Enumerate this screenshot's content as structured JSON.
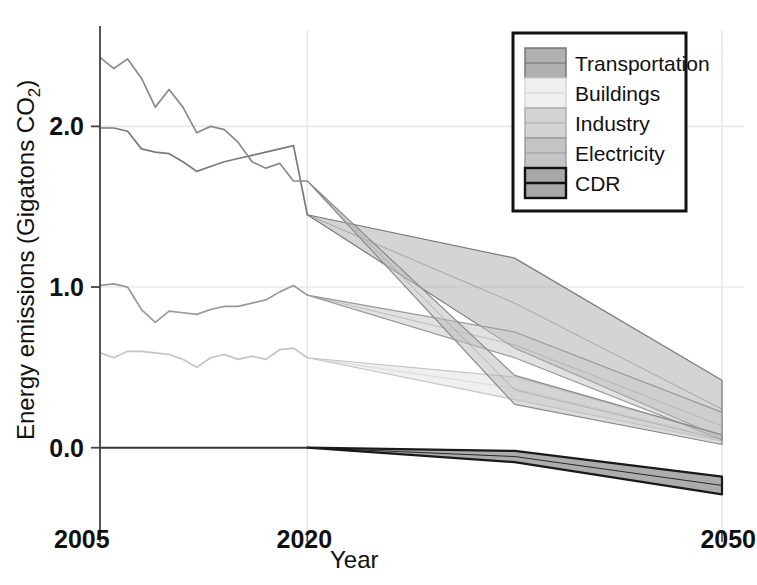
{
  "chart_data": {
    "type": "area",
    "title": "",
    "xlabel": "Year",
    "ylabel": "Energy emissions (Gigatons CO",
    "ylabel_sub": "2",
    "ylabel_tail": ")",
    "xlim": [
      2005,
      2050
    ],
    "ylim": [
      -0.45,
      2.6
    ],
    "xticks": [
      2005,
      2020,
      2050
    ],
    "xtick_labels": [
      "2005",
      "2020",
      "2050"
    ],
    "yticks": [
      0.0,
      1.0,
      2.0
    ],
    "ytick_labels": [
      "0.0",
      "1.0",
      "2.0"
    ],
    "grid": true,
    "legend_position": "top-right",
    "historical_split_year": 2020,
    "series": [
      {
        "name": "Transportation",
        "color": "#b0b0b0",
        "edge_color": "#7a7a7a",
        "historical_x": [
          2005,
          2006,
          2007,
          2008,
          2009,
          2010,
          2011,
          2012,
          2013,
          2014,
          2015,
          2016,
          2017,
          2018,
          2019,
          2020
        ],
        "historical_y": [
          1.99,
          1.99,
          1.97,
          1.86,
          1.84,
          1.83,
          1.78,
          1.72,
          1.75,
          1.78,
          1.8,
          1.82,
          1.84,
          1.86,
          1.88,
          1.45
        ],
        "projection_x": [
          2020,
          2035,
          2050
        ],
        "projection_lo": [
          1.45,
          0.62,
          0.06
        ],
        "projection_hi": [
          1.45,
          1.18,
          0.42
        ]
      },
      {
        "name": "Buildings",
        "color": "#e2e2e2",
        "edge_color": "#c4c4c4",
        "historical_x": [
          2005,
          2006,
          2007,
          2008,
          2009,
          2010,
          2011,
          2012,
          2013,
          2014,
          2015,
          2016,
          2017,
          2018,
          2019,
          2020
        ],
        "historical_y": [
          0.59,
          0.56,
          0.6,
          0.6,
          0.59,
          0.58,
          0.55,
          0.5,
          0.56,
          0.58,
          0.55,
          0.57,
          0.55,
          0.61,
          0.62,
          0.56
        ],
        "projection_x": [
          2020,
          2035,
          2050
        ],
        "projection_lo": [
          0.56,
          0.3,
          0.04
        ],
        "projection_hi": [
          0.56,
          0.44,
          0.08
        ]
      },
      {
        "name": "Industry",
        "color": "#c9c9c9",
        "edge_color": "#9a9a9a",
        "historical_x": [
          2005,
          2006,
          2007,
          2008,
          2009,
          2010,
          2011,
          2012,
          2013,
          2014,
          2015,
          2016,
          2017,
          2018,
          2019,
          2020
        ],
        "historical_y": [
          1.01,
          1.02,
          1.0,
          0.86,
          0.78,
          0.85,
          0.84,
          0.83,
          0.86,
          0.88,
          0.88,
          0.9,
          0.92,
          0.97,
          1.01,
          0.95
        ],
        "projection_x": [
          2020,
          2035,
          2050
        ],
        "projection_lo": [
          0.95,
          0.56,
          0.05
        ],
        "projection_hi": [
          0.95,
          0.72,
          0.22
        ]
      },
      {
        "name": "Electricity",
        "color": "#bdbdbd",
        "edge_color": "#8a8a8a",
        "historical_x": [
          2005,
          2006,
          2007,
          2008,
          2009,
          2010,
          2011,
          2012,
          2013,
          2014,
          2015,
          2016,
          2017,
          2018,
          2019,
          2020
        ],
        "historical_y": [
          2.43,
          2.36,
          2.42,
          2.3,
          2.12,
          2.23,
          2.12,
          1.96,
          2.0,
          1.98,
          1.9,
          1.78,
          1.74,
          1.77,
          1.66,
          1.66
        ],
        "projection_x": [
          2020,
          2035,
          2050
        ],
        "projection_lo": [
          1.66,
          0.27,
          0.02
        ],
        "projection_hi": [
          1.66,
          0.45,
          0.08
        ]
      },
      {
        "name": "CDR",
        "color": "#9e9e9e",
        "edge_color": "#1a1a1a",
        "historical_x": [
          2005,
          2020
        ],
        "historical_y": [
          0.0,
          0.0
        ],
        "projection_x": [
          2020,
          2035,
          2050
        ],
        "projection_lo": [
          0.0,
          -0.09,
          -0.29
        ],
        "projection_hi": [
          0.0,
          -0.02,
          -0.18
        ]
      }
    ]
  },
  "legend": {
    "items": [
      {
        "label": "Transportation",
        "swatch_color": "#b0b0b0",
        "swatch_edge": "#6f6f6f"
      },
      {
        "label": "Buildings",
        "swatch_color": "#efefef",
        "swatch_edge": "#d6d6d6"
      },
      {
        "label": "Industry",
        "swatch_color": "#d3d3d3",
        "swatch_edge": "#ababab"
      },
      {
        "label": "Electricity",
        "swatch_color": "#c4c4c4",
        "swatch_edge": "#999999"
      },
      {
        "label": "CDR",
        "swatch_color": "#a8a8a8",
        "swatch_edge": "#111111"
      }
    ],
    "border_color": "#111111"
  },
  "axes": {
    "spine_color": "#444444",
    "grid_color": "#e8e8e8",
    "zero_line_color": "#333333"
  }
}
